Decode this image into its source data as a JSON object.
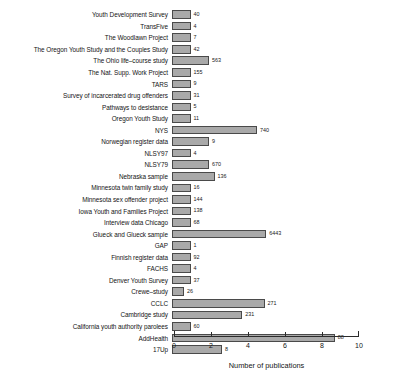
{
  "chart_data": {
    "type": "bar",
    "orientation": "horizontal",
    "title": "",
    "xlabel": "Number of publications",
    "ylabel": "",
    "xlim": [
      0,
      10
    ],
    "xticks": [
      0,
      2,
      4,
      6,
      8,
      10
    ],
    "grid": false,
    "legend": null,
    "bar_color": "#a9a9a9",
    "bar_edge_color": "#4a4a4a",
    "categories": [
      "Youth Development Survey",
      "TransFive",
      "The Woodlawn Project",
      "The Oregon Youth Study and the Couples Study",
      "The Ohio life–course study",
      "The Nat. Supp. Work Project",
      "TARS",
      "Survey of incarcerated drug offenders",
      "Pathways to desistance",
      "Oregon Youth Study",
      "NYS",
      "Norwegian register data",
      "NLSY97",
      "NLSY79",
      "Nebraska sample",
      "Minnesota twin family study",
      "Minnesota sex offender project",
      "Iowa Youth and Families Project",
      "Interview data Chicago",
      "Glueck and Glueck sample",
      "GAP",
      "Finnish register data",
      "FACHS",
      "Denver Youth Survey",
      "Crewe–study",
      "CCLC",
      "Cambridge study",
      "California youth authority parolees",
      "AddHealth",
      "17Up"
    ],
    "values": [
      1.0,
      1.0,
      1.0,
      1.0,
      2.0,
      1.0,
      1.0,
      1.0,
      1.0,
      1.0,
      4.6,
      2.0,
      1.0,
      2.0,
      2.3,
      1.0,
      1.0,
      1.0,
      1.0,
      5.1,
      1.0,
      1.0,
      1.0,
      1.0,
      0.65,
      5.0,
      3.8,
      1.0,
      8.8,
      2.7
    ],
    "point_labels": [
      "40",
      "4",
      "7",
      "42",
      "563",
      "155",
      "9",
      "31",
      "5",
      "11",
      "740",
      "9",
      "4",
      "670",
      "136",
      "16",
      "144",
      "138",
      "68",
      "6443",
      "1",
      "92",
      "4",
      "37",
      "26",
      "271",
      "231",
      "60",
      "88",
      "8"
    ]
  }
}
